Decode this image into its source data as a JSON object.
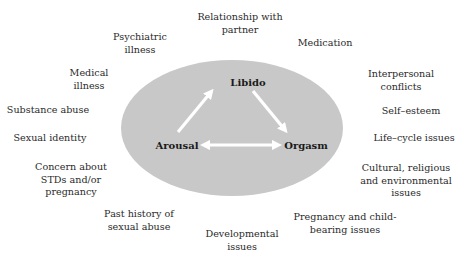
{
  "diagram": {
    "ellipse": {
      "fill": "#c8c8c8",
      "cx": 232,
      "cy": 128,
      "rx": 111,
      "ry": 68
    },
    "arrow_color": "#ffffff",
    "nodes": [
      {
        "id": "libido",
        "label": "Libido",
        "x": 248,
        "y": 82
      },
      {
        "id": "arousal",
        "label": "Arousal",
        "x": 177,
        "y": 145
      },
      {
        "id": "orgasm",
        "label": "Orgasm",
        "x": 306,
        "y": 145
      }
    ],
    "arrows": [
      {
        "from": "arousal",
        "to": "libido",
        "direction": "one-way"
      },
      {
        "from": "libido",
        "to": "orgasm",
        "direction": "one-way"
      },
      {
        "from": "arousal",
        "to": "orgasm",
        "direction": "two-way"
      }
    ],
    "factors": [
      {
        "id": "relationship",
        "label": "Relationship with\npartner",
        "x": 240,
        "y": 11
      },
      {
        "id": "psychiatric",
        "label": "Psychiatric\nillness",
        "x": 140,
        "y": 31
      },
      {
        "id": "medication",
        "label": "Medication",
        "x": 325,
        "y": 37
      },
      {
        "id": "medical",
        "label": "Medical\nillness",
        "x": 89,
        "y": 67
      },
      {
        "id": "interpersonal",
        "label": "Interpersonal\nconflicts",
        "x": 401,
        "y": 68
      },
      {
        "id": "substance",
        "label": "Substance abuse",
        "x": 48,
        "y": 104
      },
      {
        "id": "self-esteem",
        "label": "Self–esteem",
        "x": 411,
        "y": 105
      },
      {
        "id": "sexual-identity",
        "label": "Sexual identity",
        "x": 50,
        "y": 132
      },
      {
        "id": "life-cycle",
        "label": "Life–cycle issues",
        "x": 414,
        "y": 132
      },
      {
        "id": "stds",
        "label": "Concern about\nSTDs and/or\npregnancy",
        "x": 71,
        "y": 161
      },
      {
        "id": "cultural",
        "label": "Cultural, religious\nand environmental\nissues",
        "x": 406,
        "y": 162
      },
      {
        "id": "past-abuse",
        "label": "Past history of\nsexual abuse",
        "x": 139,
        "y": 208
      },
      {
        "id": "pregnancy",
        "label": "Pregnancy and child-\nbearing issues",
        "x": 345,
        "y": 211
      },
      {
        "id": "developmental",
        "label": "Developmental\nissues",
        "x": 242,
        "y": 228
      }
    ]
  }
}
